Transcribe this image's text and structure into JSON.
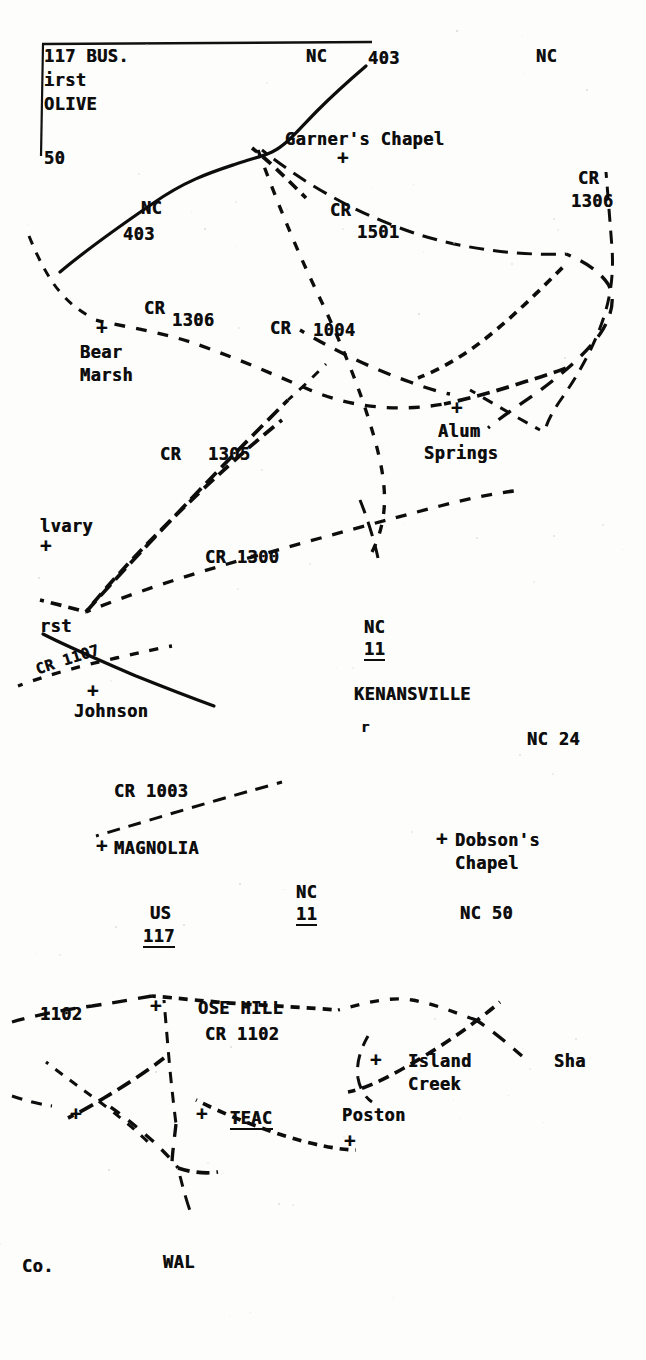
{
  "document": {
    "kind": "scanned typewritten county road map",
    "region_hint": "Duplin County, North Carolina"
  },
  "frame": {
    "visible": true
  },
  "labels": [
    {
      "id": "us-117-bus",
      "text": "117 BUS.",
      "x": 44,
      "y": 48,
      "size": "s17"
    },
    {
      "id": "first",
      "text": "irst",
      "x": 44,
      "y": 72,
      "size": "s17"
    },
    {
      "id": "olive",
      "text": "OLIVE",
      "x": 44,
      "y": 96,
      "size": "s17"
    },
    {
      "id": "nc-403-top-left",
      "text": "50",
      "x": 44,
      "y": 150,
      "size": "s17"
    },
    {
      "id": "nc-top-mid",
      "text": "NC",
      "x": 306,
      "y": 48,
      "size": "s17"
    },
    {
      "id": "route-403-top",
      "text": "403",
      "x": 368,
      "y": 50,
      "size": "s17"
    },
    {
      "id": "nc-top-right",
      "text": "NC",
      "x": 536,
      "y": 48,
      "size": "s17"
    },
    {
      "id": "garners-chapel",
      "text": "Garner's Chapel",
      "x": 285,
      "y": 131,
      "size": "s17"
    },
    {
      "id": "cr-1306-topright",
      "text": "CR",
      "x": 578,
      "y": 170,
      "size": "s17"
    },
    {
      "id": "cr-1306-topright-n",
      "text": "1306",
      "x": 571,
      "y": 193,
      "size": "s17"
    },
    {
      "id": "nc-label-403",
      "text": "NC",
      "x": 141,
      "y": 200,
      "size": "s17"
    },
    {
      "id": "route-403-mid",
      "text": "403",
      "x": 123,
      "y": 226,
      "size": "s17"
    },
    {
      "id": "cr-1501",
      "text": "CR",
      "x": 330,
      "y": 202,
      "size": "s17"
    },
    {
      "id": "cr-1501-n",
      "text": "1501",
      "x": 357,
      "y": 224,
      "size": "s17"
    },
    {
      "id": "cr-1306-left",
      "text": "CR",
      "x": 144,
      "y": 300,
      "size": "s17"
    },
    {
      "id": "cr-1306-left-n",
      "text": "1306",
      "x": 172,
      "y": 312,
      "size": "s17"
    },
    {
      "id": "cr-1004",
      "text": "CR",
      "x": 270,
      "y": 320,
      "size": "s17"
    },
    {
      "id": "cr-1004-n",
      "text": "1004",
      "x": 313,
      "y": 322,
      "size": "s17"
    },
    {
      "id": "bear-marsh",
      "text": "Bear",
      "x": 80,
      "y": 344,
      "size": "s17"
    },
    {
      "id": "bear-marsh-2",
      "text": "Marsh",
      "x": 80,
      "y": 367,
      "size": "s17"
    },
    {
      "id": "alum-springs",
      "text": "Alum",
      "x": 438,
      "y": 423,
      "size": "s17"
    },
    {
      "id": "alum-springs-2",
      "text": "Springs",
      "x": 424,
      "y": 445,
      "size": "s17"
    },
    {
      "id": "cr-1305",
      "text": "CR",
      "x": 160,
      "y": 446,
      "size": "s17"
    },
    {
      "id": "cr-1305-n",
      "text": "1305",
      "x": 208,
      "y": 446,
      "size": "s17"
    },
    {
      "id": "calvary",
      "text": "lvary",
      "x": 40,
      "y": 518,
      "size": "s17"
    },
    {
      "id": "cr-1300",
      "text": "CR 1300",
      "x": 205,
      "y": 549,
      "size": "s17"
    },
    {
      "id": "first-church",
      "text": "rst",
      "x": 40,
      "y": 618,
      "size": "s17"
    },
    {
      "id": "cr-1107",
      "text": "CR 1107",
      "x": 34,
      "y": 663,
      "size": "s15",
      "rot": -18
    },
    {
      "id": "johnson",
      "text": "Johnson",
      "x": 74,
      "y": 703,
      "size": "s17"
    },
    {
      "id": "nc-kenansville",
      "text": "NC",
      "x": 364,
      "y": 619,
      "size": "s17"
    },
    {
      "id": "route-11-ken",
      "text": "11",
      "x": 364,
      "y": 641,
      "size": "s17",
      "underline": true
    },
    {
      "id": "kenansville",
      "text": "KENANSVILLE",
      "x": 354,
      "y": 686,
      "size": "s17"
    },
    {
      "id": "ken-tick",
      "text": "r",
      "x": 361,
      "y": 720,
      "size": "s14"
    },
    {
      "id": "nc-24",
      "text": "NC 24",
      "x": 527,
      "y": 731,
      "size": "s17"
    },
    {
      "id": "cr-1003",
      "text": "CR 1003",
      "x": 114,
      "y": 783,
      "size": "s17"
    },
    {
      "id": "magnolia",
      "text": "MAGNOLIA",
      "x": 114,
      "y": 840,
      "size": "s17"
    },
    {
      "id": "dobsons-chapel",
      "text": "Dobson's",
      "x": 455,
      "y": 832,
      "size": "s17"
    },
    {
      "id": "dobsons-chapel-2",
      "text": "Chapel",
      "x": 455,
      "y": 855,
      "size": "s17"
    },
    {
      "id": "nc-magnolia",
      "text": "NC",
      "x": 296,
      "y": 884,
      "size": "s17"
    },
    {
      "id": "route-11-mag",
      "text": "11",
      "x": 296,
      "y": 906,
      "size": "s17",
      "underline": true
    },
    {
      "id": "us-117",
      "text": "US",
      "x": 150,
      "y": 905,
      "size": "s17"
    },
    {
      "id": "route-117",
      "text": "117",
      "x": 143,
      "y": 928,
      "size": "s17",
      "underline": true
    },
    {
      "id": "nc-50",
      "text": "NC 50",
      "x": 460,
      "y": 905,
      "size": "s17"
    },
    {
      "id": "cr-1102-left",
      "text": "1102",
      "x": 40,
      "y": 1006,
      "size": "s17"
    },
    {
      "id": "rose-hill",
      "text": "OSE HILL",
      "x": 198,
      "y": 1000,
      "size": "s17"
    },
    {
      "id": "cr-1102",
      "text": "CR 1102",
      "x": 205,
      "y": 1026,
      "size": "s17"
    },
    {
      "id": "island-creek",
      "text": "Island",
      "x": 408,
      "y": 1053,
      "size": "s17"
    },
    {
      "id": "island-creek-2",
      "text": "Creek",
      "x": 408,
      "y": 1076,
      "size": "s17"
    },
    {
      "id": "sharon",
      "text": "Sha",
      "x": 554,
      "y": 1053,
      "size": "s17"
    },
    {
      "id": "teachey",
      "text": "TEAC",
      "x": 230,
      "y": 1110,
      "size": "s17",
      "underline": true
    },
    {
      "id": "poston",
      "text": "Poston",
      "x": 342,
      "y": 1107,
      "size": "s17"
    },
    {
      "id": "county-label",
      "text": "Co.",
      "x": 22,
      "y": 1258,
      "size": "s17"
    },
    {
      "id": "wallace",
      "text": "WAL",
      "x": 163,
      "y": 1254,
      "size": "s17"
    }
  ],
  "crosses": [
    {
      "id": "cross-garners-chapel",
      "x": 337,
      "y": 148
    },
    {
      "id": "cross-bear-marsh",
      "x": 96,
      "y": 318
    },
    {
      "id": "cross-alum-springs",
      "x": 451,
      "y": 398
    },
    {
      "id": "cross-calvary",
      "x": 40,
      "y": 536
    },
    {
      "id": "cross-johnson",
      "x": 87,
      "y": 681
    },
    {
      "id": "cross-magnolia",
      "x": 96,
      "y": 836
    },
    {
      "id": "cross-dobsons-chapel",
      "x": 436,
      "y": 829
    },
    {
      "id": "cross-rose-hill",
      "x": 150,
      "y": 996
    },
    {
      "id": "cross-island-creek",
      "x": 370,
      "y": 1050
    },
    {
      "id": "cross-west-small",
      "x": 70,
      "y": 1104
    },
    {
      "id": "cross-teachey",
      "x": 196,
      "y": 1104
    },
    {
      "id": "cross-poston",
      "x": 344,
      "y": 1131
    }
  ],
  "roads": {
    "solid": [
      {
        "id": "nc-403-primary",
        "d": "M 60 272 C 86 250, 120 226, 152 204 C 186 180, 212 172, 236 164 C 254 158, 264 156, 272 152 C 288 144, 300 128, 318 110 C 336 92, 352 78, 366 66"
      },
      {
        "id": "us-117-south",
        "d": "M 43 634 C 70 648, 104 662, 136 676 C 166 688, 192 698, 214 706"
      }
    ],
    "dashed": [
      {
        "id": "cr-1306-west-edge",
        "d": "M 29 236 C 38 258, 48 278, 60 292 C 72 306, 82 312, 92 318"
      },
      {
        "id": "cr-1306-bearmarsh",
        "d": "M 96 320 C 120 326, 150 330, 184 340 C 222 352, 268 372, 310 390 C 352 408, 400 412, 444 404"
      },
      {
        "id": "cr-1306-east",
        "d": "M 444 404 C 472 398, 500 390, 524 382 C 544 376, 556 372, 566 368"
      },
      {
        "id": "cr-1501-main",
        "d": "M 262 150 C 300 180, 346 208, 400 228 C 452 248, 516 256, 566 254"
      },
      {
        "id": "cr-1004-diag",
        "d": "M 258 150 C 272 188, 292 240, 316 290 C 340 340, 362 392, 376 444 C 386 482, 390 516, 372 552"
      },
      {
        "id": "garners-spur",
        "d": "M 252 148 C 268 160, 286 178, 306 198"
      },
      {
        "id": "cr-1306-right-vert",
        "d": "M 606 172 C 608 196, 610 222, 612 248 C 614 276, 610 302, 600 328 C 590 354, 576 378, 562 398 C 552 412, 546 424, 544 434"
      },
      {
        "id": "cr-right-loop",
        "d": "M 566 254 C 586 262, 600 272, 608 284 C 616 298, 612 316, 600 334 C 586 354, 562 374, 538 392 C 518 406, 500 418, 488 428"
      },
      {
        "id": "alum-north-spur",
        "d": "M 418 378 C 444 368, 470 352, 496 330 C 520 310, 544 286, 566 264"
      },
      {
        "id": "alum-cross-spur",
        "d": "M 470 390 C 494 404, 518 418, 540 430"
      },
      {
        "id": "alum-west-feed",
        "d": "M 300 330 C 330 348, 370 368, 410 382 C 426 388, 440 392, 450 394"
      },
      {
        "id": "cr-1305-diag",
        "d": "M 86 612 C 116 578, 154 538, 192 498 C 226 462, 260 428, 288 400"
      },
      {
        "id": "cr-1305-upper",
        "d": "M 288 400 C 304 386, 316 374, 326 364"
      },
      {
        "id": "cr-1300-main",
        "d": "M 86 612 C 130 594, 190 574, 256 556 C 320 538, 386 520, 440 506 C 478 496, 504 492, 522 490"
      },
      {
        "id": "cr-1300-branch",
        "d": "M 86 612 C 120 570, 160 530, 200 492 C 234 460, 262 436, 282 420"
      },
      {
        "id": "cr-1300-east-tail",
        "d": "M 360 500 C 368 520, 374 540, 378 558"
      },
      {
        "id": "cr-1107-dash",
        "d": "M 18 686 C 44 676, 80 666, 116 658 C 142 652, 160 648, 172 646"
      },
      {
        "id": "calvary-spur",
        "d": "M 40 600 C 56 604, 72 608, 86 612"
      },
      {
        "id": "cr-1003-dash",
        "d": "M 96 836 C 130 826, 176 812, 218 800 C 246 792, 268 786, 282 782"
      },
      {
        "id": "cr-1102-w",
        "d": "M 12 1022 C 34 1016, 60 1010, 92 1006 C 118 1002, 140 998, 152 996"
      },
      {
        "id": "cr-1102-main",
        "d": "M 152 996 C 178 998, 210 1002, 244 1004 C 276 1006, 310 1008, 338 1010"
      },
      {
        "id": "rose-hill-vert",
        "d": "M 164 1000 C 166 1024, 168 1048, 170 1070 C 172 1090, 174 1108, 176 1124"
      },
      {
        "id": "rose-hill-south",
        "d": "M 176 1124 C 174 1142, 172 1156, 172 1164"
      },
      {
        "id": "rose-hill-sw",
        "d": "M 164 1058 C 146 1072, 124 1086, 104 1098 C 88 1108, 76 1114, 68 1118"
      },
      {
        "id": "rose-hill-x",
        "d": "M 46 1062 C 64 1076, 86 1092, 108 1108 C 126 1122, 140 1134, 150 1144"
      },
      {
        "id": "teachey-loop-w",
        "d": "M 100 1100 C 116 1110, 136 1126, 154 1142 C 166 1154, 174 1162, 178 1168"
      },
      {
        "id": "teachey-loop-s",
        "d": "M 178 1168 C 190 1172, 204 1174, 218 1172"
      },
      {
        "id": "teachey-tail",
        "d": "M 180 1176 C 184 1192, 188 1206, 192 1216"
      },
      {
        "id": "island-creek-ne",
        "d": "M 338 1010 C 362 1004, 388 996, 412 1000 C 436 1004, 458 1014, 476 1020"
      },
      {
        "id": "island-creek-diag",
        "d": "M 500 1002 C 474 1024, 440 1048, 404 1068 C 380 1082, 360 1090, 348 1092"
      },
      {
        "id": "island-creek-box",
        "d": "M 368 1036 C 360 1050, 356 1064, 358 1078 C 360 1090, 366 1098, 372 1102"
      },
      {
        "id": "island-creek-east",
        "d": "M 476 1020 C 492 1030, 508 1044, 522 1056"
      },
      {
        "id": "teachey-ne-leg",
        "d": "M 196 1100 C 228 1116, 268 1132, 306 1142 C 330 1148, 346 1150, 356 1150"
      },
      {
        "id": "west-tail-lower",
        "d": "M 12 1096 C 24 1100, 38 1104, 52 1106"
      }
    ]
  }
}
